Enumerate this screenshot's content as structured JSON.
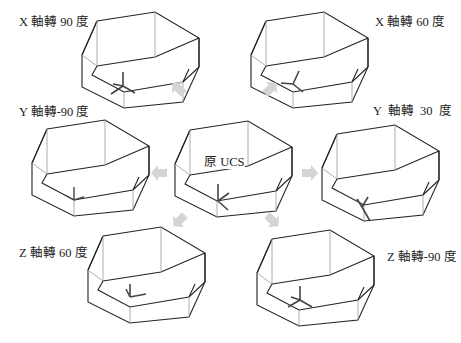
{
  "figure": {
    "center": {
      "label": "原 UCS"
    },
    "views": [
      {
        "id": "x90",
        "label": "X 軸轉 90 度",
        "axis": "X",
        "angle": 90
      },
      {
        "id": "x60",
        "label": "X 軸轉 60 度",
        "axis": "X",
        "angle": 60
      },
      {
        "id": "ym90",
        "label": "Y 軸轉-90 度",
        "axis": "Y",
        "angle": -90
      },
      {
        "id": "y30",
        "label": "Y  軸轉  30  度",
        "axis": "Y",
        "angle": 30
      },
      {
        "id": "z60",
        "label": "Z 軸轉 60 度",
        "axis": "Z",
        "angle": 60
      },
      {
        "id": "zm90",
        "label": "Z 軸轉-90 度",
        "axis": "Z",
        "angle": -90
      }
    ],
    "arrow_color": "#d4d4d4",
    "line_color": "#222222",
    "hidden_line_color": "#9a9a9a"
  }
}
